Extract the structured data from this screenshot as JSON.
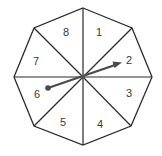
{
  "figure": {
    "type": "spinner",
    "shape": "regular octagon",
    "sector_count": 8,
    "sectors": [
      {
        "label": "1"
      },
      {
        "label": "2"
      },
      {
        "label": "3"
      },
      {
        "label": "4"
      },
      {
        "label": "5"
      },
      {
        "label": "6"
      },
      {
        "label": "7"
      },
      {
        "label": "8"
      }
    ],
    "arrow": {
      "points_to": "2",
      "tail_in": "6"
    },
    "colors": {
      "outline": "#2b2b2b",
      "arrow": "#4a4a4a",
      "background": "#ffffff",
      "label": "#3a3a3a"
    }
  }
}
